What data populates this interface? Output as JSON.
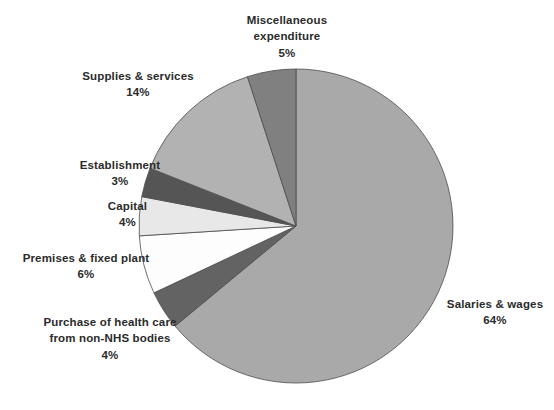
{
  "chart_data": {
    "type": "pie",
    "title": "",
    "xlabel": "",
    "ylabel": "",
    "legend_position": "callout-labels",
    "grid": false,
    "units": "percent",
    "total": 100,
    "start_angle_deg": 0,
    "direction": "clockwise",
    "categories": [
      "Salaries & wages",
      "Purchase of health care from non-NHS bodies",
      "Premises & fixed plant",
      "Capital",
      "Establishment",
      "Supplies & services",
      "Miscellaneous expenditure"
    ],
    "values": [
      64,
      4,
      6,
      4,
      3,
      14,
      5
    ],
    "colors": [
      "#a9a9a9",
      "#636363",
      "#fdfdfd",
      "#e8e8e8",
      "#555555",
      "#b2b2b2",
      "#808080"
    ],
    "slices": [
      {
        "name": "Salaries & wages",
        "value": 64,
        "value_label": "64%",
        "color": "#a9a9a9",
        "label_line1": "Salaries & wages",
        "label_line2": "",
        "label_pct": "64%"
      },
      {
        "name": "Purchase of health care from non-NHS bodies",
        "value": 4,
        "value_label": "4%",
        "color": "#636363",
        "label_line1": "Purchase of health care",
        "label_line2": "from non-NHS bodies",
        "label_pct": "4%"
      },
      {
        "name": "Premises & fixed plant",
        "value": 6,
        "value_label": "6%",
        "color": "#fdfdfd",
        "label_line1": "Premises & fixed plant",
        "label_line2": "",
        "label_pct": "6%"
      },
      {
        "name": "Capital",
        "value": 4,
        "value_label": "4%",
        "color": "#e8e8e8",
        "label_line1": "Capital",
        "label_line2": "",
        "label_pct": "4%"
      },
      {
        "name": "Establishment",
        "value": 3,
        "value_label": "3%",
        "color": "#555555",
        "label_line1": "Establishment",
        "label_line2": "",
        "label_pct": "3%"
      },
      {
        "name": "Supplies & services",
        "value": 14,
        "value_label": "14%",
        "color": "#b2b2b2",
        "label_line1": "Supplies & services",
        "label_line2": "",
        "label_pct": "14%"
      },
      {
        "name": "Miscellaneous expenditure",
        "value": 5,
        "value_label": "5%",
        "color": "#808080",
        "label_line1": "Miscellaneous",
        "label_line2": "expenditure",
        "label_pct": "5%"
      }
    ]
  },
  "geometry": {
    "center_x": 296,
    "center_y": 226,
    "radius": 157,
    "stroke_color": "#4d4d4d",
    "stroke_width": 0.8
  },
  "labels": {
    "miscellaneous": {
      "line1": "Miscellaneous",
      "line2": "expenditure",
      "pct": "5%"
    },
    "supplies": {
      "line1": "Supplies & services",
      "pct": "14%"
    },
    "establishment": {
      "line1": "Establishment",
      "pct": "3%"
    },
    "capital": {
      "line1": "Capital",
      "pct": "4%"
    },
    "premises": {
      "line1": "Premises & fixed plant",
      "pct": "6%"
    },
    "purchase": {
      "line1": "Purchase of health care",
      "line2": "from non-NHS bodies",
      "pct": "4%"
    },
    "salaries": {
      "line1": "Salaries & wages",
      "pct": "64%"
    }
  }
}
